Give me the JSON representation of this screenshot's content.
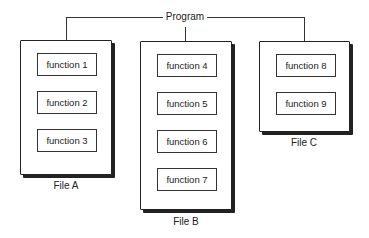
{
  "program": {
    "label": "Program"
  },
  "files": [
    {
      "label": "File A",
      "functions": [
        "function 1",
        "function 2",
        "function 3"
      ]
    },
    {
      "label": "File B",
      "functions": [
        "function 4",
        "function 5",
        "function 6",
        "function 7"
      ]
    },
    {
      "label": "File C",
      "functions": [
        "function 8",
        "function 9"
      ]
    }
  ],
  "colors": {
    "stroke": "#222222",
    "background": "#ffffff"
  }
}
